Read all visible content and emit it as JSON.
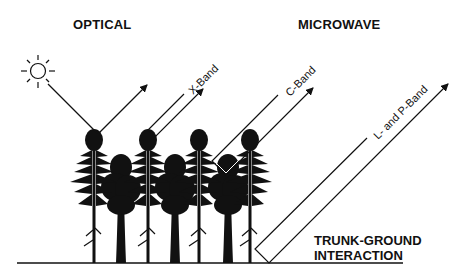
{
  "headers": {
    "optical": "OPTICAL",
    "microwave": "MICROWAVE"
  },
  "bands": [
    {
      "label": "X-Band"
    },
    {
      "label": "C-Band"
    },
    {
      "label": "L- and P-Band"
    }
  ],
  "annotation": {
    "line1": "TRUNK-GROUND",
    "line2": "INTERACTION"
  },
  "icons": {
    "sun": "sun-icon",
    "tree": "tree-icon"
  },
  "colors": {
    "ink": "#111111",
    "background": "#ffffff"
  }
}
